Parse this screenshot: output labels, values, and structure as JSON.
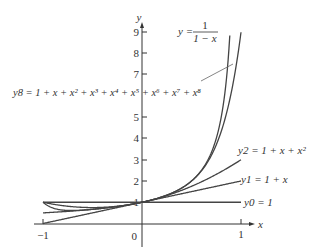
{
  "chart_data": {
    "type": "line",
    "title": "",
    "xlabel": "x",
    "ylabel": "y",
    "xlim": [
      -1,
      1
    ],
    "ylim": [
      0,
      9
    ],
    "grid": false,
    "x_ticks": [
      "-1",
      "0",
      "1"
    ],
    "y_ticks": [
      "1",
      "2",
      "3",
      "4",
      "5",
      "7",
      "8",
      "9"
    ],
    "series": [
      {
        "name": "y = 1/(1 - x)",
        "formula": "1/(1-x)",
        "label": "y = 1/(1 − x)"
      },
      {
        "name": "y8 = 1 + x + x^2 + x^3 + x^4 + x^5 + x^6 + x^7 + x^8",
        "formula": "sum x^k, k=0..8"
      },
      {
        "name": "y2 = 1 + x + x^2",
        "formula": "1+x+x^2"
      },
      {
        "name": "y1 = 1 + x",
        "formula": "1+x"
      },
      {
        "name": "y0 = 1",
        "formula": "1"
      }
    ],
    "annotations": [
      "y = 1/(1 − x)",
      "y8 = 1 + x + x² + x³ + x⁴ + x⁵ + x⁶ + x⁷ + x⁸",
      "y2 = 1 + x + x²",
      "y1 = 1 + x",
      "y0 = 1"
    ]
  },
  "labels": {
    "y_axis": "y",
    "x_axis": "x",
    "origin": "0",
    "xneg": "−1",
    "xpos": "1",
    "ytick_1": "1",
    "ytick_2": "2",
    "ytick_3": "3",
    "ytick_4": "4",
    "ytick_5": "5",
    "ytick_7": "7",
    "ytick_8": "8",
    "ytick_9": "9",
    "f_y": "y =",
    "f_num": "1",
    "f_den": "1 − x",
    "y8_label": "y8 = 1 + x + x² + x³ + x⁴ + x⁵ + x⁶ + x⁷ + x⁸",
    "y2_label": "y2 = 1 + x + x²",
    "y1_label": "y1 = 1 + x",
    "y0_label": "y0 = 1"
  },
  "colors": {
    "curve": "#444444",
    "axis": "#333333",
    "leader": "#666666"
  }
}
